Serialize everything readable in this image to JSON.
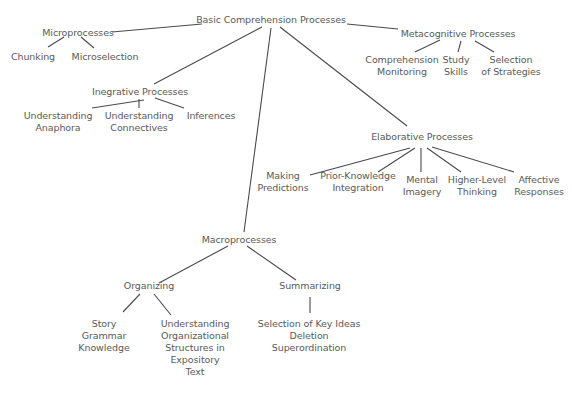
{
  "diagram": {
    "type": "concept-tree",
    "colors": {
      "text": "#5a5a5a",
      "line": "#4a4a4a",
      "background": "#ffffff"
    },
    "nodes": {
      "root": "Basic Comprehension Processes",
      "micro": "Microprocesses",
      "chunking": "Chunking",
      "microselection": "Microselection",
      "meta": "Metacognitive Processes",
      "comp_mon": "Comprehension\nMonitoring",
      "study": "Study\nSkills",
      "sel_strat": "Selection\nof Strategies",
      "integrative": "Inegrative Processes",
      "anaphora": "Understanding\nAnaphora",
      "connectives": "Understanding\nConnectives",
      "inferences": "Inferences",
      "elaborative": "Elaborative Processes",
      "predictions": "Making\nPredictions",
      "prior": "Prior-Knowledge\nIntegration",
      "imagery": "Mental\nImagery",
      "higher": "Higher-Level\nThinking",
      "affective": "Affective\nResponses",
      "macro": "Macroprocesses",
      "organizing": "Organizing",
      "story": "Story\nGrammar\nKnowledge",
      "org_struct": "Understanding\nOrganizational\nStructures in\nExpository\nText",
      "summarizing": "Summarizing",
      "summ_items": "Selection of Key Ideas\nDeletion\nSuperordination"
    }
  }
}
